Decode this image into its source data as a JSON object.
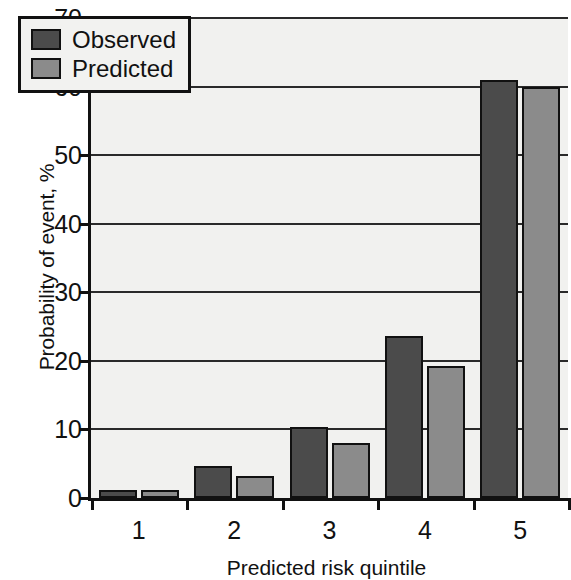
{
  "chart_data": {
    "type": "bar",
    "title": "",
    "xlabel": "Predicted risk quintile",
    "ylabel": "Probability of event, %",
    "categories": [
      "1",
      "2",
      "3",
      "4",
      "5"
    ],
    "series": [
      {
        "name": "Observed",
        "color": "#4b4b4b",
        "values": [
          1.2,
          4.7,
          10.4,
          23.6,
          60.9
        ]
      },
      {
        "name": "Predicted",
        "color": "#8b8b8b",
        "values": [
          1.1,
          3.2,
          8.0,
          19.2,
          60.0
        ]
      }
    ],
    "ylim": [
      0,
      70
    ],
    "yticks": [
      0,
      10,
      20,
      30,
      40,
      50,
      60,
      70
    ],
    "ytick_labels": [
      "0",
      "10",
      "20",
      "30",
      "40",
      "50",
      "60",
      "70"
    ],
    "grid": true,
    "legend_position": "top-left"
  },
  "legend": {
    "entries": [
      {
        "label": "Observed",
        "color": "#4b4b4b"
      },
      {
        "label": "Predicted",
        "color": "#8b8b8b"
      }
    ]
  },
  "axes": {
    "y_title": "Probability of event, %",
    "x_title": "Predicted risk quintile"
  }
}
